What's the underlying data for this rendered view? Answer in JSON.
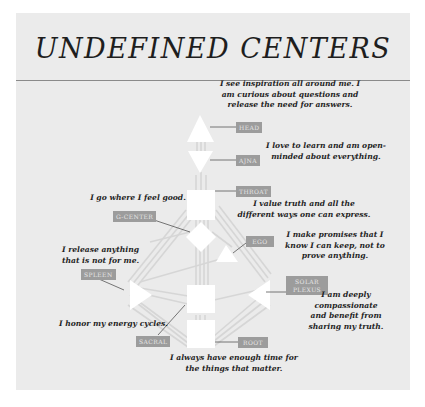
{
  "title": "UNDEFINED CENTERS",
  "colors": {
    "panel_bg": "#ebebeb",
    "center_fill": "#ffffff",
    "channel": "#d4d4d4",
    "label_bg": "#9c9c9c",
    "label_text": "#e6e6e6",
    "text": "#1f1f1f"
  },
  "centers": [
    {
      "id": "head",
      "label": "HEAD",
      "shape": "triangle-up",
      "affirmation": "I see inspiration all around me. I am curious about questions and release the need for answers."
    },
    {
      "id": "ajna",
      "label": "AJNA",
      "shape": "triangle-down",
      "affirmation": "I love to learn and am open-minded about everything."
    },
    {
      "id": "throat",
      "label": "THROAT",
      "shape": "square",
      "affirmation": "I value truth and all the different ways one can express."
    },
    {
      "id": "g-center",
      "label": "G-CENTER",
      "shape": "diamond",
      "affirmation": "I go where I feel good."
    },
    {
      "id": "ego",
      "label": "EGO",
      "shape": "triangle-small",
      "affirmation": "I make promises that I know I can keep, not to prove anything."
    },
    {
      "id": "spleen",
      "label": "SPLEEN",
      "shape": "triangle-right",
      "affirmation": "I release anything that is not for me."
    },
    {
      "id": "solar-plexus",
      "label": "SOLAR PLEXUS",
      "shape": "triangle-left",
      "affirmation": "I am deeply compassionate and benefit from sharing my truth."
    },
    {
      "id": "sacral",
      "label": "SACRAL",
      "shape": "square",
      "affirmation": "I honor my energy cycles."
    },
    {
      "id": "root",
      "label": "ROOT",
      "shape": "square",
      "affirmation": "I always have enough time for the things that matter."
    }
  ],
  "text": {
    "head_l1": "I see inspiration all around me. I",
    "head_l2": "am curious about questions and",
    "head_l3": "release the need for answers.",
    "ajna_l1": "I love to learn and am open-",
    "ajna_l2": "minded about everything.",
    "throat_l1": "I value truth and all the",
    "throat_l2": "different ways one can express.",
    "g_l1": "I go where I feel good.",
    "ego_l1": "I make promises that I",
    "ego_l2": "know I can keep, not to",
    "ego_l3": "prove anything.",
    "spleen_l1": "I release anything",
    "spleen_l2": "that is not for me.",
    "solar_l1": "I am deeply",
    "solar_l2": "compassionate",
    "solar_l3": "and benefit from",
    "solar_l4": "sharing my truth.",
    "sacral_l1": "I honor my energy cycles.",
    "root_l1": "I always have enough time for",
    "root_l2": "the things that matter.",
    "label_head": "HEAD",
    "label_ajna": "AJNA",
    "label_throat": "THROAT",
    "label_g": "G-CENTER",
    "label_ego": "EGO",
    "label_spleen": "SPLEEN",
    "label_solar_1": "SOLAR",
    "label_solar_2": "PLEXUS",
    "label_sacral": "SACRAL",
    "label_root": "ROOT"
  }
}
